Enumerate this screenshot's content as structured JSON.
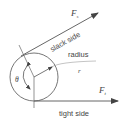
{
  "diagram": {
    "labels": {
      "slack_force": "F",
      "slack_force_sub": "s",
      "slack_side": "slack side",
      "radius": "radius",
      "radius_symbol": "r",
      "angle": "θ",
      "tight_force": "F",
      "tight_force_sub": "t",
      "tight_side": "tight side"
    },
    "colors": {
      "line": "#555555",
      "text": "#444444",
      "background": "#ffffff"
    }
  }
}
